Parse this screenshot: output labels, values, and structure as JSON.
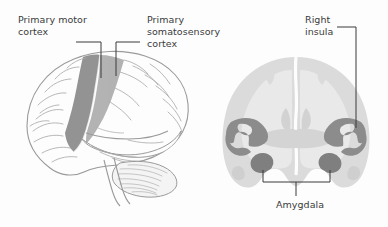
{
  "figure": {
    "background_color": "#fdfdfd",
    "text_color": "#3b3b3b",
    "panels": [
      {
        "id": "lateral-view",
        "name": "Lateral view of the left cerebral hemisphere",
        "highlighted_regions": [
          "primary motor cortex",
          "primary somatosensory cortex"
        ]
      },
      {
        "id": "coronal-section",
        "name": "Coronal section of the brain",
        "highlighted_regions": [
          "right insula",
          "left insula",
          "amygdala"
        ]
      }
    ]
  },
  "labels": {
    "primary_motor_cortex": "Primary motor\ncortex",
    "primary_somatosensory_cortex": "Primary\nsomatosensory\ncortex",
    "right_insula": "Right\ninsula",
    "amygdala": "Amygdala"
  },
  "colors": {
    "outline": "#9a9a9a",
    "motor_cortex_shade": "#8a8a8a",
    "somatosensory_cortex_shade": "#a9a9a9",
    "coronal_cortex": "#dbdbdb",
    "coronal_white_matter": "#e9e9e9",
    "insula_shade": "#8c8c8c",
    "amygdala_shade": "#7f7f7f",
    "leader_line": "#3b3b3b",
    "text": "#3b3b3b",
    "background": "#fdfdfd"
  }
}
